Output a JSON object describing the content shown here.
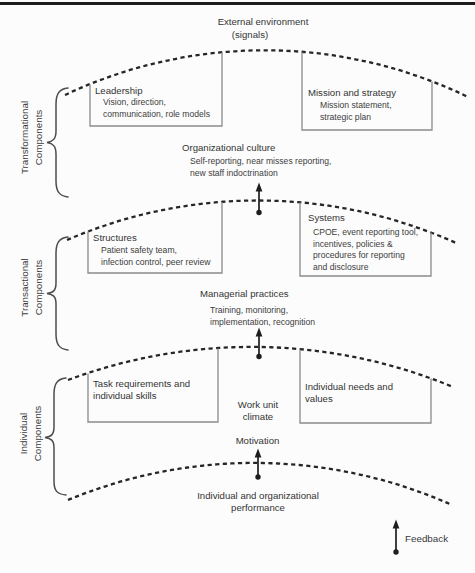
{
  "palette": {
    "ink": "#383838",
    "dash_line": "#262626",
    "box_border": "#8a8a8a",
    "background": "#fcfcfc"
  },
  "header": {
    "title": "External environment",
    "subtitle": "(signals)"
  },
  "side_labels": {
    "transformational": {
      "line1": "Transformational",
      "line2": "Components"
    },
    "transactional": {
      "line1": "Transactional",
      "line2": "Components"
    },
    "individual": {
      "line1": "Individual",
      "line2": "Components"
    }
  },
  "boxes": {
    "leadership": {
      "title": "Leadership",
      "line1": "Vision, direction,",
      "line2": "communication, role models"
    },
    "mission_strategy": {
      "title": "Mission and strategy",
      "line1": "Mission statement,",
      "line2": "strategic plan"
    },
    "structures": {
      "title": "Structures",
      "line1": "Patient safety team,",
      "line2": "infection control, peer review"
    },
    "systems": {
      "title": "Systems",
      "line1": "CPOE, event reporting tool,",
      "line2": "incentives, policies &",
      "line3": "procedures for reporting",
      "line4": "and disclosure"
    },
    "task_requirements": {
      "line1": "Task requirements and",
      "line2": "individual skills"
    },
    "individual_needs": {
      "line1": "Individual needs and",
      "line2": "values"
    }
  },
  "nodes": {
    "organizational_culture": {
      "title": "Organizational culture",
      "line1": "Self-reporting, near misses reporting,",
      "line2": "new staff indoctrination"
    },
    "managerial_practices": {
      "title": "Managerial practices",
      "line1": "Training, monitoring,",
      "line2": "implementation, recognition"
    },
    "work_unit_climate": {
      "line1": "Work unit",
      "line2": "climate"
    },
    "motivation": {
      "title": "Motivation"
    },
    "performance": {
      "line1": "Individual and organizational",
      "line2": "performance"
    },
    "feedback": {
      "label": "Feedback"
    }
  }
}
